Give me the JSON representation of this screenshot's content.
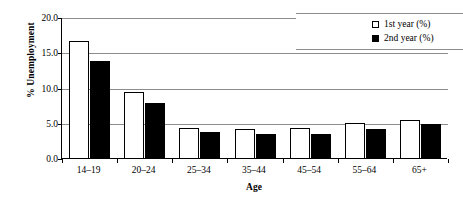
{
  "chart_data": {
    "type": "bar",
    "title": "",
    "xlabel": "Age",
    "ylabel": "% Unemployment",
    "categories": [
      "14–19",
      "20–24",
      "25–34",
      "35–44",
      "45–54",
      "55–64",
      "65+"
    ],
    "series": [
      {
        "name": "1st year (%)",
        "values": [
          16.8,
          9.5,
          4.4,
          4.2,
          4.4,
          5.1,
          5.6
        ],
        "color": "#ffffff",
        "edgecolor": "#000000"
      },
      {
        "name": "2nd year (%)",
        "values": [
          13.9,
          8.0,
          3.8,
          3.5,
          3.5,
          4.3,
          5.0
        ],
        "color": "#000000",
        "edgecolor": "#000000"
      }
    ],
    "ylim": [
      0.0,
      20.0
    ],
    "yticks": [
      "0.0",
      "5.0",
      "10.0",
      "15.0",
      "20.0"
    ],
    "ytick_values": [
      0.0,
      5.0,
      10.0,
      15.0,
      20.0
    ],
    "grid": "horizontal",
    "legend_position": "top-right"
  },
  "legend": {
    "entries": [
      {
        "label": "1st year (%)",
        "marker": "open-square"
      },
      {
        "label": "2nd year (%)",
        "marker": "filled-square"
      }
    ]
  }
}
